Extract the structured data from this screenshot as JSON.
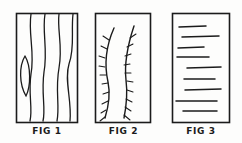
{
  "plate": {
    "title": "Three hand-drawn figure panels",
    "background_color": "#fdfdfc",
    "ink_color": "#1b1b1b"
  },
  "panels": [
    {
      "id": "fig1",
      "caption": "FIG 1",
      "pattern_name": "wavy-vertical-grain",
      "description": "Rectangle filled with four wavy vertical grain lines and one small closed loop knot at the left",
      "frame": {
        "x": 1,
        "y": 1,
        "width": 62,
        "height": 110
      },
      "stroke_color": "#1b1b1b",
      "grain_lines": [
        "M 16 2 C 13 22, 20 40, 16 62 C 13 82, 18 96, 15 109",
        "M 30 2 C 27 20, 33 38, 29 60 C 26 82, 31 96, 28 109",
        "M 44 2 C 42 18, 48 34, 44 56 C 40 78, 45 94, 42 109",
        "M 58 2 C 56 20, 60 36, 54 52 C 49 68, 57 88, 55 109"
      ],
      "knot_loop": "M 10 44 C 4 54, 4 72, 11 84 C 16 74, 16 54, 10 44"
    },
    {
      "id": "fig2",
      "caption": "FIG 2",
      "pattern_name": "branched-stems",
      "description": "Rectangle containing two curving vertical stems, each with many short angled barbs like a feather or fern",
      "frame": {
        "x": 1,
        "y": 1,
        "width": 56,
        "height": 110
      },
      "stroke_color": "#1b1b1b",
      "stems": [
        "M 20 16 C 12 34, 10 52, 14 70 C 17 84, 14 96, 11 106",
        "M 40 14 C 34 32, 30 50, 32 68 C 34 84, 32 96, 30 106"
      ],
      "barbs": [
        "M 15 28 L 9 24",
        "M 13 37 L 7 34",
        "M 11 46 L 5 44",
        "M 11 55 L 5 54",
        "M 12 63 L 6 63",
        "M 14 71 L 8 72",
        "M 15 80 L 9 82",
        "M 14 89 L 8 92",
        "M 12 98 L 7 101",
        "M 11 105 L 6 109",
        "M 36 26 L 42 22",
        "M 33 35 L 39 32",
        "M 31 44 L 37 42",
        "M 30 53 L 36 52",
        "M 31 61 L 37 61",
        "M 33 69 L 39 70",
        "M 33 78 L 39 80",
        "M 32 87 L 38 90",
        "M 31 95 L 37 99",
        "M 30 103 L 36 108"
      ]
    },
    {
      "id": "fig3",
      "caption": "FIG 3",
      "pattern_name": "horizontal-strata",
      "description": "Rectangle filled with nine roughly horizontal lines of varying length and indentation",
      "frame": {
        "x": 1,
        "y": 1,
        "width": 58,
        "height": 110
      },
      "stroke_color": "#1b1b1b",
      "strata_lines": [
        {
          "x1": 8,
          "y1": 15,
          "x2": 35,
          "y2": 14
        },
        {
          "x1": 11,
          "y1": 25,
          "x2": 48,
          "y2": 24
        },
        {
          "x1": 7,
          "y1": 36,
          "x2": 33,
          "y2": 35
        },
        {
          "x1": 6,
          "y1": 45,
          "x2": 38,
          "y2": 45
        },
        {
          "x1": 16,
          "y1": 56,
          "x2": 50,
          "y2": 55
        },
        {
          "x1": 13,
          "y1": 67,
          "x2": 44,
          "y2": 67
        },
        {
          "x1": 14,
          "y1": 78,
          "x2": 50,
          "y2": 77
        },
        {
          "x1": 5,
          "y1": 89,
          "x2": 46,
          "y2": 89
        },
        {
          "x1": 12,
          "y1": 99,
          "x2": 46,
          "y2": 99
        }
      ]
    }
  ]
}
